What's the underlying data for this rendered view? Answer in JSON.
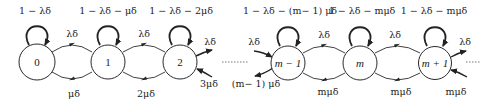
{
  "diagram": {
    "type": "birth-death markov chain",
    "nodes": [
      {
        "id": "0",
        "label": "0",
        "self_loop": "1 − λδ",
        "cx": 37,
        "cy": 62
      },
      {
        "id": "1",
        "label": "1",
        "self_loop": "1 − λδ  − μδ",
        "cx": 108,
        "cy": 62
      },
      {
        "id": "2",
        "label": "2",
        "self_loop": "1 − λδ  − 2μδ",
        "cx": 180,
        "cy": 62
      },
      {
        "id": "m-1",
        "label": "m − 1",
        "self_loop": "1 − λδ  − (m− 1) μδ",
        "cx": 288,
        "cy": 63
      },
      {
        "id": "m",
        "label": "m",
        "self_loop": "1 − λδ  − mμδ",
        "cx": 360,
        "cy": 63
      },
      {
        "id": "m+1",
        "label": "m + 1",
        "self_loop": "1 − λδ  − mμδ",
        "cx": 435,
        "cy": 63
      }
    ],
    "forward_edges": [
      {
        "from": "0",
        "to": "1",
        "label": "λδ"
      },
      {
        "from": "1",
        "to": "2",
        "label": "λδ"
      },
      {
        "from": "2",
        "to": "…",
        "label": "λδ"
      },
      {
        "from": "…",
        "to": "m-1",
        "label": "λδ"
      },
      {
        "from": "m-1",
        "to": "m",
        "label": "λδ"
      },
      {
        "from": "m",
        "to": "m+1",
        "label": "λδ"
      },
      {
        "from": "m+1",
        "to": "…",
        "label": "λδ"
      }
    ],
    "backward_edges": [
      {
        "from": "1",
        "to": "0",
        "label": "μδ"
      },
      {
        "from": "2",
        "to": "1",
        "label": "2μδ"
      },
      {
        "from": "…",
        "to": "2",
        "label": "3μδ"
      },
      {
        "from": "m-1",
        "to": "…",
        "label": "(m− 1) μδ"
      },
      {
        "from": "m",
        "to": "m-1",
        "label": "mμδ"
      },
      {
        "from": "m+1",
        "to": "m",
        "label": "mμδ"
      },
      {
        "from": "…",
        "to": "m+1",
        "label": "mμδ"
      }
    ],
    "ellipsis": "......"
  }
}
